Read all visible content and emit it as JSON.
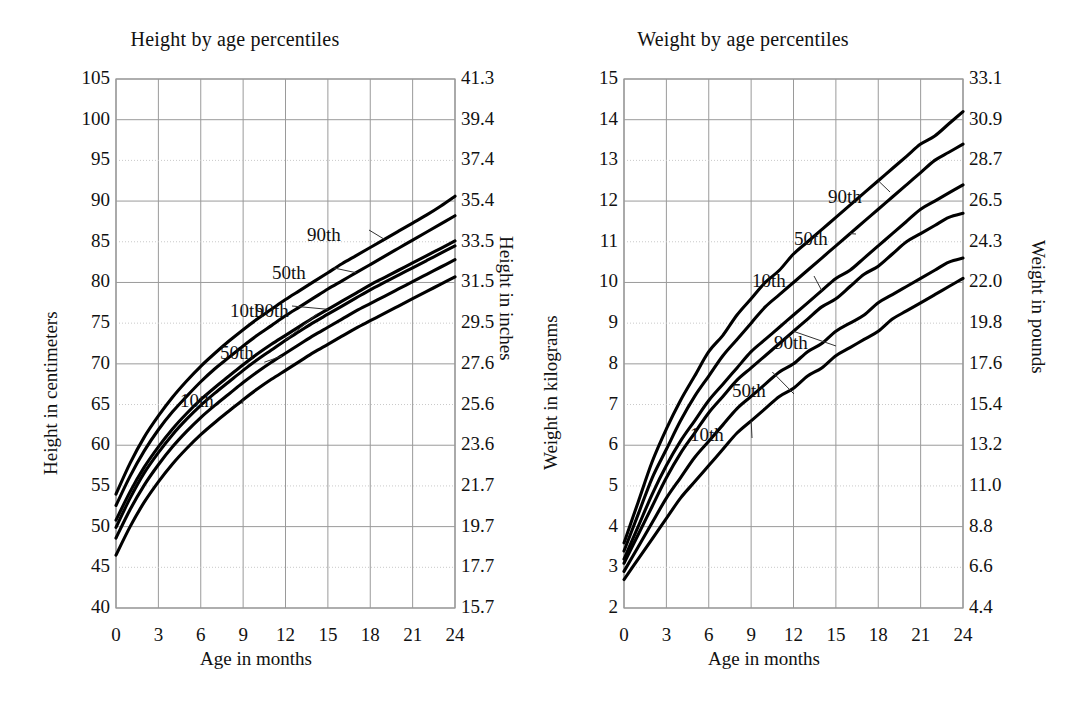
{
  "figure": {
    "background": "#ffffff",
    "ink": "#111111",
    "grid_color": "#9a9a9a",
    "grid_minor_color": "#c9c9c9",
    "curve_color": "#000000"
  },
  "panels": [
    {
      "id": "height",
      "title": "Height by age percentiles",
      "ylabel_left": "Height in centimeters",
      "ylabel_right": "Height in inches",
      "xlabel": "Age in months",
      "x_ticks": [
        "0",
        "3",
        "6",
        "9",
        "12",
        "15",
        "18",
        "21",
        "24"
      ],
      "y_ticks_left": [
        "40",
        "45",
        "50",
        "55",
        "60",
        "65",
        "70",
        "75",
        "80",
        "85",
        "90",
        "95",
        "100",
        "105"
      ],
      "y_ticks_right": [
        "15.7",
        "17.7",
        "19.7",
        "21.7",
        "23.6",
        "25.6",
        "27.6",
        "29.5",
        "31.5",
        "33.5",
        "35.4",
        "37.4",
        "39.4",
        "41.3"
      ],
      "series_labels": [
        {
          "text": "90th",
          "group": "upper"
        },
        {
          "text": "50th",
          "group": "upper"
        },
        {
          "text": "10th",
          "group": "upper"
        },
        {
          "text": "90th",
          "group": "lower"
        },
        {
          "text": "50th",
          "group": "lower"
        },
        {
          "text": "10th",
          "group": "lower"
        }
      ]
    },
    {
      "id": "weight",
      "title": "Weight by age percentiles",
      "ylabel_left": "Weight in kilograms",
      "ylabel_right": "Weight in pounds",
      "xlabel": "Age in months",
      "x_ticks": [
        "0",
        "3",
        "6",
        "9",
        "12",
        "15",
        "18",
        "21",
        "24"
      ],
      "y_ticks_left": [
        "2",
        "3",
        "4",
        "5",
        "6",
        "7",
        "8",
        "9",
        "10",
        "11",
        "12",
        "13",
        "14",
        "15"
      ],
      "y_ticks_right": [
        "4.4",
        "6.6",
        "8.8",
        "11.0",
        "13.2",
        "15.4",
        "17.6",
        "19.8",
        "22.0",
        "24.3",
        "26.5",
        "28.7",
        "30.9",
        "33.1"
      ],
      "series_labels": [
        {
          "text": "90th",
          "group": "upper"
        },
        {
          "text": "50th",
          "group": "upper"
        },
        {
          "text": "10th",
          "group": "upper"
        },
        {
          "text": "90th",
          "group": "lower"
        },
        {
          "text": "50th",
          "group": "lower"
        },
        {
          "text": "10th",
          "group": "lower"
        }
      ]
    }
  ],
  "chart_data": [
    {
      "type": "line",
      "title": "Height by age percentiles",
      "xlabel": "Age in months",
      "ylabel": "Height in centimeters",
      "ylabel_secondary": "Height in inches",
      "xlim": [
        0,
        24
      ],
      "ylim": [
        40,
        105
      ],
      "ylim_secondary": [
        15.7,
        41.3
      ],
      "grid": true,
      "legend": "inline-annotations",
      "x": [
        0,
        1,
        2,
        3,
        4,
        5,
        6,
        7,
        8,
        9,
        10,
        11,
        12,
        13,
        14,
        15,
        16,
        17,
        18,
        19,
        20,
        21,
        22,
        23,
        24
      ],
      "series": [
        {
          "name": "90th (upper group)",
          "values": [
            54.0,
            57.8,
            61.0,
            63.6,
            65.9,
            67.9,
            69.7,
            71.3,
            72.8,
            74.2,
            75.5,
            76.7,
            77.9,
            79.0,
            80.1,
            81.2,
            82.3,
            83.3,
            84.3,
            85.3,
            86.3,
            87.3,
            88.3,
            89.4,
            90.6
          ]
        },
        {
          "name": "50th (upper group)",
          "values": [
            52.6,
            56.2,
            59.3,
            61.9,
            64.1,
            66.0,
            67.8,
            69.4,
            70.8,
            72.2,
            73.5,
            74.7,
            75.9,
            77.0,
            78.1,
            79.2,
            80.2,
            81.2,
            82.2,
            83.2,
            84.2,
            85.2,
            86.2,
            87.2,
            88.2
          ]
        },
        {
          "name": "10th (upper group)",
          "values": [
            50.8,
            54.3,
            57.3,
            59.8,
            62.0,
            63.9,
            65.6,
            67.1,
            68.5,
            69.9,
            71.2,
            72.4,
            73.5,
            74.6,
            75.7,
            76.7,
            77.7,
            78.7,
            79.7,
            80.6,
            81.5,
            82.4,
            83.3,
            84.2,
            85.1
          ]
        },
        {
          "name": "90th (lower group)",
          "values": [
            49.9,
            53.5,
            56.6,
            59.1,
            61.3,
            63.2,
            64.9,
            66.4,
            67.8,
            69.2,
            70.5,
            71.7,
            72.9,
            74.0,
            75.1,
            76.1,
            77.1,
            78.1,
            79.1,
            80.0,
            80.9,
            81.8,
            82.7,
            83.6,
            84.5
          ]
        },
        {
          "name": "50th (lower group)",
          "values": [
            48.6,
            52.1,
            55.1,
            57.6,
            59.8,
            61.7,
            63.4,
            64.9,
            66.3,
            67.7,
            69.0,
            70.2,
            71.3,
            72.4,
            73.5,
            74.5,
            75.5,
            76.5,
            77.4,
            78.3,
            79.2,
            80.1,
            81.0,
            81.9,
            82.8
          ]
        },
        {
          "name": "10th (lower group)",
          "values": [
            46.5,
            50.0,
            53.0,
            55.5,
            57.7,
            59.6,
            61.3,
            62.8,
            64.2,
            65.6,
            66.9,
            68.1,
            69.2,
            70.3,
            71.4,
            72.4,
            73.4,
            74.4,
            75.3,
            76.2,
            77.1,
            78.0,
            78.9,
            79.8,
            80.7
          ]
        }
      ]
    },
    {
      "type": "line",
      "title": "Weight by age percentiles",
      "xlabel": "Age in months",
      "ylabel": "Weight in kilograms",
      "ylabel_secondary": "Weight in pounds",
      "xlim": [
        0,
        24
      ],
      "ylim": [
        2,
        15
      ],
      "ylim_secondary": [
        4.4,
        33.1
      ],
      "grid": true,
      "legend": "inline-annotations",
      "x": [
        0,
        1,
        2,
        3,
        4,
        5,
        6,
        7,
        8,
        9,
        10,
        11,
        12,
        13,
        14,
        15,
        16,
        17,
        18,
        19,
        20,
        21,
        22,
        23,
        24
      ],
      "series": [
        {
          "name": "90th (upper group)",
          "values": [
            3.6,
            4.6,
            5.6,
            6.4,
            7.1,
            7.7,
            8.3,
            8.7,
            9.2,
            9.6,
            10.0,
            10.3,
            10.7,
            11.0,
            11.3,
            11.6,
            11.9,
            12.2,
            12.5,
            12.8,
            13.1,
            13.4,
            13.6,
            13.9,
            14.2
          ]
        },
        {
          "name": "50th (upper group)",
          "values": [
            3.4,
            4.3,
            5.2,
            5.9,
            6.6,
            7.2,
            7.7,
            8.2,
            8.6,
            9.0,
            9.4,
            9.7,
            10.0,
            10.3,
            10.6,
            10.9,
            11.2,
            11.5,
            11.8,
            12.1,
            12.4,
            12.7,
            13.0,
            13.2,
            13.4
          ]
        },
        {
          "name": "10th (upper group)",
          "values": [
            3.2,
            4.0,
            4.8,
            5.5,
            6.1,
            6.6,
            7.1,
            7.5,
            7.9,
            8.3,
            8.6,
            8.9,
            9.2,
            9.5,
            9.8,
            10.1,
            10.3,
            10.6,
            10.9,
            11.2,
            11.5,
            11.8,
            12.0,
            12.2,
            12.4
          ]
        },
        {
          "name": "90th (lower group)",
          "values": [
            3.1,
            3.8,
            4.5,
            5.2,
            5.8,
            6.3,
            6.8,
            7.2,
            7.6,
            7.9,
            8.2,
            8.5,
            8.8,
            9.1,
            9.4,
            9.6,
            9.9,
            10.2,
            10.4,
            10.7,
            11.0,
            11.2,
            11.4,
            11.6,
            11.7
          ]
        },
        {
          "name": "50th (lower group)",
          "values": [
            2.9,
            3.5,
            4.1,
            4.7,
            5.2,
            5.7,
            6.1,
            6.5,
            6.9,
            7.2,
            7.5,
            7.8,
            8.0,
            8.3,
            8.5,
            8.8,
            9.0,
            9.2,
            9.5,
            9.7,
            9.9,
            10.1,
            10.3,
            10.5,
            10.6
          ]
        },
        {
          "name": "10th (lower group)",
          "values": [
            2.7,
            3.2,
            3.7,
            4.2,
            4.7,
            5.1,
            5.5,
            5.9,
            6.3,
            6.6,
            6.9,
            7.2,
            7.4,
            7.7,
            7.9,
            8.2,
            8.4,
            8.6,
            8.8,
            9.1,
            9.3,
            9.5,
            9.7,
            9.9,
            10.1
          ]
        }
      ]
    }
  ]
}
